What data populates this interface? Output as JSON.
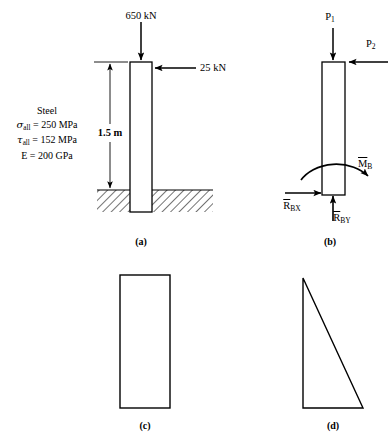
{
  "figure": {
    "panels": [
      {
        "key": "a",
        "caption": "(a)",
        "loads": {
          "axial": "650 kN",
          "lateral": "25 kN"
        },
        "dimension": "1.5 m",
        "material": {
          "name": "Steel",
          "sigma_symbol": "σ",
          "sigma_sub": "all",
          "sigma_value": "= 250 MPa",
          "tau_symbol": "τ",
          "tau_sub": "all",
          "tau_value": "= 152 MPa",
          "modulus_symbol": "E",
          "modulus_value": "= 200 GPa"
        }
      },
      {
        "key": "b",
        "caption": "(b)",
        "loads": {
          "axial_symbol": "P",
          "axial_sub": "1",
          "lateral_symbol": "P",
          "lateral_sub": "2"
        },
        "reactions": {
          "moment_symbol": "M",
          "moment_sub": "B",
          "horizontal_symbol": "R",
          "horizontal_sub": "BX",
          "vertical_symbol": "R",
          "vertical_sub": "BY"
        }
      },
      {
        "key": "c",
        "caption": "(c)",
        "shape": "rectangle"
      },
      {
        "key": "d",
        "caption": "(d)",
        "shape": "right-triangle"
      }
    ],
    "colors": {
      "line": "#000000",
      "hatch": "#000000",
      "background": "#ffffff"
    }
  }
}
